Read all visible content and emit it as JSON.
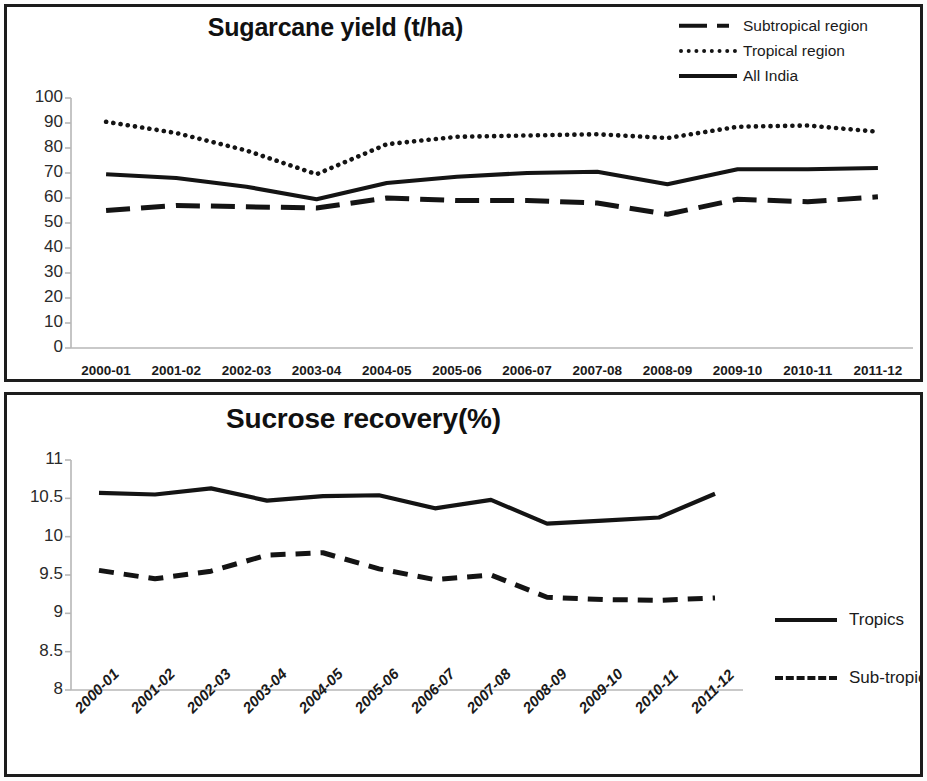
{
  "figure": {
    "panels": [
      "sugarcane-yield-panel",
      "sucrose-recovery-panel"
    ]
  },
  "chart_data": [
    {
      "type": "line",
      "id": "sugarcane-yield",
      "title": "Sugarcane yield (t/ha)",
      "xlabel": "",
      "ylabel": "",
      "ylim": [
        0,
        100
      ],
      "ytick_step": 10,
      "yticks": [
        "100",
        "90",
        "80",
        "70",
        "60",
        "50",
        "40",
        "30",
        "20",
        "10",
        "0"
      ],
      "grid": false,
      "legend_position": "top-right",
      "categories": [
        "2000-01",
        "2001-02",
        "2002-03",
        "2003-04",
        "2004-05",
        "2005-06",
        "2006-07",
        "2007-08",
        "2008-09",
        "2009-10",
        "2010-11",
        "2011-12"
      ],
      "series": [
        {
          "name": "Subtropical region",
          "style": "dash-dot",
          "values": [
            55.0,
            57.0,
            56.5,
            56.0,
            60.0,
            59.0,
            59.0,
            58.0,
            53.5,
            59.5,
            58.5,
            60.5
          ]
        },
        {
          "name": "Tropical region",
          "style": "dotted",
          "values": [
            90.5,
            86.0,
            79.0,
            69.5,
            81.5,
            84.5,
            85.0,
            85.5,
            84.0,
            88.5,
            89.0,
            86.5
          ]
        },
        {
          "name": "All India",
          "style": "solid",
          "values": [
            69.5,
            68.0,
            64.5,
            59.5,
            66.0,
            68.5,
            70.0,
            70.5,
            65.5,
            71.5,
            71.5,
            72.0
          ]
        }
      ]
    },
    {
      "type": "line",
      "id": "sucrose-recovery",
      "title": "Sucrose recovery(%)",
      "xlabel": "",
      "ylabel": "",
      "ylim": [
        8,
        11
      ],
      "ytick_step": 0.5,
      "yticks": [
        "11",
        "10.5",
        "10",
        "9.5",
        "9",
        "8.5",
        "8"
      ],
      "grid": false,
      "legend_position": "right",
      "categories": [
        "2000-01",
        "2001-02",
        "2002-03",
        "2003-04",
        "2004-05",
        "2005-06",
        "2006-07",
        "2007-08",
        "2008-09",
        "2009-10",
        "2010-11",
        "2011-12"
      ],
      "series": [
        {
          "name": "Tropics",
          "style": "solid",
          "values": [
            10.57,
            10.55,
            10.63,
            10.47,
            10.53,
            10.54,
            10.37,
            10.48,
            10.17,
            10.21,
            10.25,
            10.56
          ]
        },
        {
          "name": "Sub-tropics",
          "style": "dashed",
          "values": [
            9.56,
            9.45,
            9.55,
            9.76,
            9.79,
            9.58,
            9.44,
            9.5,
            9.21,
            9.18,
            9.17,
            9.2
          ]
        }
      ]
    }
  ],
  "colors": {
    "line": "#141414",
    "axis": "#b7b7b7",
    "border": "#1c1c1c",
    "text": "#1a1a1a",
    "background": "#ffffff"
  }
}
